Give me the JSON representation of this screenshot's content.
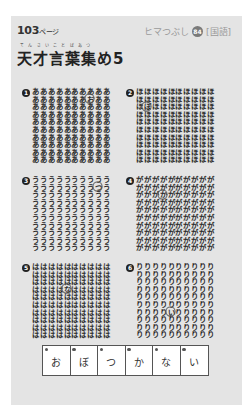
{
  "header": {
    "page_number": "103",
    "page_suffix": "ページ",
    "series_label": "ヒマつぶし",
    "series_number": "84",
    "subject": "[国語]"
  },
  "title": {
    "furigana": "てんさいことばあつ",
    "text": "天才言葉集め5"
  },
  "puzzles": [
    {
      "number": "1",
      "base_char": "あ",
      "odd_char": "お",
      "odd_row": 2,
      "odd_col": 8,
      "rows": 10,
      "cols": 10
    },
    {
      "number": "2",
      "base_char": "ほ",
      "odd_char": "ぼ",
      "odd_row": 3,
      "odd_col": 2,
      "rows": 10,
      "cols": 10
    },
    {
      "number": "3",
      "base_char": "う",
      "odd_char": "つ",
      "odd_row": 2,
      "odd_col": 9,
      "rows": 10,
      "cols": 10
    },
    {
      "number": "4",
      "base_char": "が",
      "odd_char": "か",
      "odd_row": 3,
      "odd_col": 4,
      "rows": 10,
      "cols": 10
    },
    {
      "number": "5",
      "base_char": "は",
      "odd_char": "な",
      "odd_row": 4,
      "odd_col": 5,
      "rows": 10,
      "cols": 10
    },
    {
      "number": "6",
      "base_char": "り",
      "odd_char": "い",
      "odd_row": 7,
      "odd_col": 5,
      "rows": 10,
      "cols": 10
    }
  ],
  "answers": [
    {
      "index": "1",
      "char": "お"
    },
    {
      "index": "2",
      "char": "ぼ"
    },
    {
      "index": "3",
      "char": "つ"
    },
    {
      "index": "4",
      "char": "か"
    },
    {
      "index": "5",
      "char": "な"
    },
    {
      "index": "6",
      "char": "い"
    }
  ]
}
